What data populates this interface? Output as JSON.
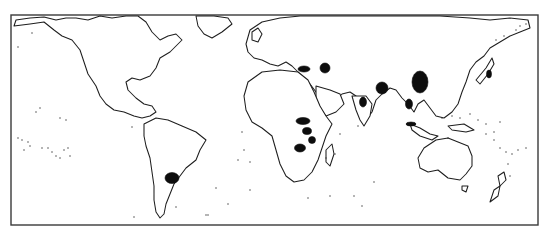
{
  "map": {
    "type": "world-map-line-art",
    "projection": "miller-like, Pacific-split (Americas left, Asia/Oceania right)",
    "frame": {
      "x": 11,
      "y": 15,
      "width": 527,
      "height": 210
    },
    "colors": {
      "background": "#ffffff",
      "coastline": "#1e1e1e",
      "highlight_fill": "#0d0d0d",
      "frame": "#3a3a3a"
    },
    "landmasses": [
      {
        "name": "north-america",
        "path": "M14,26 L30,24 L44,22 L54,30 L62,36 L72,40 L80,50 L84,62 L88,74 L96,86 L100,96 L106,104 L114,110 L124,112 L134,116 L142,118 L150,116 L156,112 L152,106 L144,104 L136,98 L128,90 L126,82 L132,78 L140,80 L150,76 L156,68 L160,58 L170,52 L176,46 L182,40 L176,34 L168,36 L160,40 L152,32 L146,22 L138,16 L126,16 L112,18 L100,16 L88,20 L76,18 L66,18 L56,20 L44,17 L30,18 L16,20 Z"
      },
      {
        "name": "greenland",
        "path": "M196,16 L214,16 L228,18 L232,24 L222,32 L212,38 L204,34 L198,26 Z"
      },
      {
        "name": "south-america",
        "path": "M144,124 L156,118 L168,120 L182,126 L196,132 L206,140 L200,150 L196,160 L186,168 L180,176 L174,184 L170,194 L166,204 L164,214 L160,218 L156,212 L154,200 L154,186 L152,172 L150,158 L146,146 L144,136 Z"
      },
      {
        "name": "eurasia",
        "path": "M250,30 L262,22 L280,18 L300,16 L330,16 L360,16 L400,16 L440,16 L470,18 L490,20 L510,18 L528,20 L530,28 L520,32 L510,36 L500,42 L490,48 L484,56 L476,62 L470,70 L466,82 L462,92 L458,104 L452,112 L444,118 L436,116 L430,108 L424,100 L418,104 L414,112 L408,104 L402,98 L396,90 L390,88 L382,94 L376,100 L372,112 L366,120 L362,110 L356,96 L350,92 L342,94 L336,100 L330,104 L322,100 L316,92 L310,84 L304,78 L298,72 L292,66 L286,62 L278,66 L270,64 L262,60 L254,58 L248,52 L246,44 Z"
      },
      {
        "name": "arabia",
        "path": "M316,86 L330,90 L340,94 L344,104 L336,112 L326,116 L320,108 L316,98 Z"
      },
      {
        "name": "india",
        "path": "M352,96 L366,96 L372,104 L370,116 L364,126 L360,120 L356,110 Z"
      },
      {
        "name": "africa",
        "path": "M248,82 L262,72 L280,70 L298,72 L308,80 L314,92 L320,106 L326,116 L332,124 L326,136 L322,148 L318,160 L312,172 L304,180 L294,182 L286,176 L280,164 L276,150 L272,136 L262,128 L252,122 L246,110 L244,96 Z"
      },
      {
        "name": "madagascar",
        "path": "M326,150 L332,144 L334,154 L330,166 L326,162 Z"
      },
      {
        "name": "uk-ireland",
        "path": "M252,32 L258,28 L262,34 L258,42 L252,40 Z"
      },
      {
        "name": "japan",
        "path": "M476,80 L486,68 L492,58 L494,64 L488,74 L480,84 Z"
      },
      {
        "name": "borneo-sumatra",
        "path": "M410,124 L420,128 L430,134 L438,136 L432,140 L420,136 L412,130 Z"
      },
      {
        "name": "new-guinea",
        "path": "M448,126 L464,124 L474,130 L466,132 L452,130 Z"
      },
      {
        "name": "australia",
        "path": "M424,148 L436,140 L448,138 L458,142 L468,146 L472,156 L472,166 L466,174 L460,180 L448,178 L438,170 L428,172 L420,168 L418,158 Z"
      },
      {
        "name": "tasmania",
        "path": "M462,186 L468,186 L466,192 L462,190 Z"
      },
      {
        "name": "new-zealand-north",
        "path": "M498,176 L504,172 L506,180 L500,186 Z"
      },
      {
        "name": "new-zealand-south",
        "path": "M494,190 L500,186 L498,196 L490,202 Z"
      }
    ],
    "highlighted_regions": [
      {
        "name": "argentina-pampas",
        "cx": 172,
        "cy": 178,
        "rx": 7,
        "ry": 5.5
      },
      {
        "name": "east-africa-north",
        "cx": 303,
        "cy": 121,
        "rx": 7,
        "ry": 3.5
      },
      {
        "name": "east-africa-mid",
        "cx": 307,
        "cy": 131,
        "rx": 4.5,
        "ry": 3.5
      },
      {
        "name": "east-africa-south",
        "cx": 312,
        "cy": 140,
        "rx": 3.5,
        "ry": 3.5
      },
      {
        "name": "southern-africa",
        "cx": 300,
        "cy": 148,
        "rx": 5.5,
        "ry": 4
      },
      {
        "name": "anatolia-levant",
        "cx": 304,
        "cy": 69,
        "rx": 6,
        "ry": 3
      },
      {
        "name": "caucasus-iran",
        "cx": 325,
        "cy": 68,
        "rx": 5,
        "ry": 5
      },
      {
        "name": "central-india",
        "cx": 382,
        "cy": 88,
        "rx": 6,
        "ry": 6
      },
      {
        "name": "south-india",
        "cx": 363,
        "cy": 102,
        "rx": 3.5,
        "ry": 5
      },
      {
        "name": "east-china",
        "cx": 420,
        "cy": 82,
        "rx": 8,
        "ry": 11
      },
      {
        "name": "south-china-vietnam",
        "cx": 409,
        "cy": 104,
        "rx": 3.5,
        "ry": 5
      },
      {
        "name": "japan-strip",
        "cx": 489,
        "cy": 74,
        "rx": 2.5,
        "ry": 4
      },
      {
        "name": "sumatra-strip",
        "cx": 411,
        "cy": 124,
        "rx": 5,
        "ry": 2
      }
    ],
    "island_dots": [
      [
        18,
        47
      ],
      [
        32,
        33
      ],
      [
        40,
        108
      ],
      [
        36,
        112
      ],
      [
        60,
        118
      ],
      [
        66,
        120
      ],
      [
        18,
        138
      ],
      [
        22,
        140
      ],
      [
        28,
        142
      ],
      [
        30,
        146
      ],
      [
        42,
        148
      ],
      [
        48,
        148
      ],
      [
        52,
        152
      ],
      [
        56,
        156
      ],
      [
        60,
        158
      ],
      [
        64,
        150
      ],
      [
        68,
        148
      ],
      [
        70,
        156
      ],
      [
        24,
        150
      ],
      [
        132,
        127
      ],
      [
        242,
        132
      ],
      [
        244,
        150
      ],
      [
        250,
        162
      ],
      [
        238,
        160
      ],
      [
        250,
        190
      ],
      [
        228,
        204
      ],
      [
        208,
        215
      ],
      [
        176,
        207
      ],
      [
        134,
        217
      ],
      [
        206,
        215
      ],
      [
        216,
        188
      ],
      [
        308,
        198
      ],
      [
        330,
        196
      ],
      [
        354,
        196
      ],
      [
        362,
        206
      ],
      [
        374,
        182
      ],
      [
        335,
        154
      ],
      [
        340,
        134
      ],
      [
        358,
        126
      ],
      [
        326,
        158
      ],
      [
        448,
        138
      ],
      [
        486,
        134
      ],
      [
        494,
        140
      ],
      [
        500,
        148
      ],
      [
        506,
        152
      ],
      [
        512,
        154
      ],
      [
        518,
        150
      ],
      [
        526,
        148
      ],
      [
        508,
        164
      ],
      [
        510,
        176
      ],
      [
        442,
        118
      ],
      [
        452,
        116
      ],
      [
        460,
        118
      ],
      [
        470,
        114
      ],
      [
        478,
        120
      ],
      [
        486,
        124
      ],
      [
        494,
        132
      ],
      [
        500,
        122
      ],
      [
        516,
        30
      ],
      [
        520,
        26
      ],
      [
        526,
        24
      ],
      [
        504,
        36
      ],
      [
        496,
        40
      ]
    ]
  }
}
